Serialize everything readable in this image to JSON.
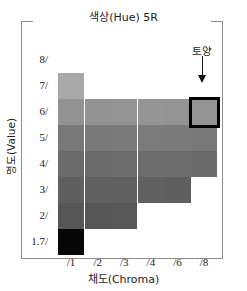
{
  "chart_data": {
    "type": "heatmap",
    "title": "색상(Hue) 5R",
    "xlabel": "채도(Chroma)",
    "ylabel": "명도(Value)",
    "grid": false,
    "legend_position": "none",
    "categories": [
      "/1",
      "/2",
      "/3",
      "/4",
      "/6",
      "/8"
    ],
    "rows": [
      "8/",
      "7/",
      "6/",
      "5/",
      "4/",
      "3/",
      "2/",
      "1.7/"
    ],
    "annotations": [
      {
        "text": "토양",
        "target_row": "6/",
        "target_column": "/8",
        "marker": "down-arrow",
        "highlight": "#000000"
      }
    ],
    "cells": [
      {
        "row": "8/",
        "col": "/1",
        "value": null
      },
      {
        "row": "8/",
        "col": "/2",
        "value": null
      },
      {
        "row": "8/",
        "col": "/3",
        "value": null
      },
      {
        "row": "8/",
        "col": "/4",
        "value": null
      },
      {
        "row": "8/",
        "col": "/6",
        "value": null
      },
      {
        "row": "8/",
        "col": "/8",
        "value": null
      },
      {
        "row": "7/",
        "col": "/1",
        "value": "#a8a8a8"
      },
      {
        "row": "7/",
        "col": "/2",
        "value": null
      },
      {
        "row": "7/",
        "col": "/3",
        "value": null
      },
      {
        "row": "7/",
        "col": "/4",
        "value": null
      },
      {
        "row": "7/",
        "col": "/6",
        "value": null
      },
      {
        "row": "7/",
        "col": "/8",
        "value": null
      },
      {
        "row": "6/",
        "col": "/1",
        "value": "#929292"
      },
      {
        "row": "6/",
        "col": "/2",
        "value": "#929292"
      },
      {
        "row": "6/",
        "col": "/3",
        "value": "#949494"
      },
      {
        "row": "6/",
        "col": "/4",
        "value": "#959595"
      },
      {
        "row": "6/",
        "col": "/6",
        "value": "#939393"
      },
      {
        "row": "6/",
        "col": "/8",
        "value": "#939393",
        "highlighted": true
      },
      {
        "row": "5/",
        "col": "/1",
        "value": "#787878"
      },
      {
        "row": "5/",
        "col": "/2",
        "value": "#787878"
      },
      {
        "row": "5/",
        "col": "/3",
        "value": "#7a7a7a"
      },
      {
        "row": "5/",
        "col": "/4",
        "value": "#7b7b7b"
      },
      {
        "row": "5/",
        "col": "/6",
        "value": "#7a7a7a"
      },
      {
        "row": "5/",
        "col": "/8",
        "value": "#787878"
      },
      {
        "row": "4/",
        "col": "/1",
        "value": "#6b6b6b"
      },
      {
        "row": "4/",
        "col": "/2",
        "value": "#6b6b6b"
      },
      {
        "row": "4/",
        "col": "/3",
        "value": "#6d6d6d"
      },
      {
        "row": "4/",
        "col": "/4",
        "value": "#6d6d6d"
      },
      {
        "row": "4/",
        "col": "/6",
        "value": "#6c6c6c"
      },
      {
        "row": "4/",
        "col": "/8",
        "value": "#6a6a6a"
      },
      {
        "row": "3/",
        "col": "/1",
        "value": "#5f5f5f"
      },
      {
        "row": "3/",
        "col": "/2",
        "value": "#606060"
      },
      {
        "row": "3/",
        "col": "/3",
        "value": "#606060"
      },
      {
        "row": "3/",
        "col": "/4",
        "value": "#616161"
      },
      {
        "row": "3/",
        "col": "/6",
        "value": "#5f5f5f"
      },
      {
        "row": "3/",
        "col": "/8",
        "value": null
      },
      {
        "row": "2/",
        "col": "/1",
        "value": "#565656"
      },
      {
        "row": "2/",
        "col": "/2",
        "value": "#565656"
      },
      {
        "row": "2/",
        "col": "/3",
        "value": "#575757"
      },
      {
        "row": "2/",
        "col": "/4",
        "value": null
      },
      {
        "row": "2/",
        "col": "/6",
        "value": null
      },
      {
        "row": "2/",
        "col": "/8",
        "value": null
      },
      {
        "row": "1.7/",
        "col": "/1",
        "value": "#070707"
      },
      {
        "row": "1.7/",
        "col": "/2",
        "value": null
      },
      {
        "row": "1.7/",
        "col": "/3",
        "value": null
      },
      {
        "row": "1.7/",
        "col": "/4",
        "value": null
      },
      {
        "row": "1.7/",
        "col": "/6",
        "value": null
      },
      {
        "row": "1.7/",
        "col": "/8",
        "value": null
      }
    ]
  }
}
